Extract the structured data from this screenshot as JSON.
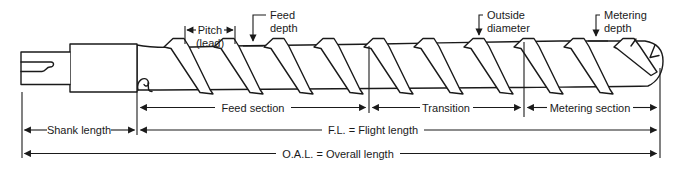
{
  "diagram": {
    "callouts": {
      "pitch": [
        "Pitch",
        "(lead)"
      ],
      "feed_depth": [
        "Feed",
        "depth"
      ],
      "outside_diameter": [
        "Outside",
        "diameter"
      ],
      "metering_depth": [
        "Metering",
        "depth"
      ]
    },
    "sections": [
      "Feed section",
      "Transition",
      "Metering section"
    ],
    "dimensions": {
      "shank": "Shank length",
      "flight": "F.L. = Flight length",
      "overall": "O.A.L. = Overall length"
    },
    "colors": {
      "line": "#1a1a1a",
      "background": "#ffffff"
    }
  }
}
